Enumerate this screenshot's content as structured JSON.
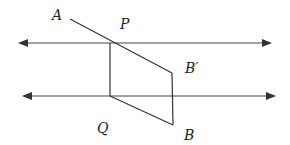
{
  "diagram": {
    "type": "geometry",
    "colors": {
      "line": "#333333",
      "background": "#ffffff"
    },
    "points": {
      "A": {
        "label": "A",
        "x": 70,
        "y": 19,
        "label_x": 55,
        "label_y": 19
      },
      "P": {
        "label": "P",
        "x": 110,
        "y": 43,
        "label_x": 121,
        "label_y": 27
      },
      "B_prime": {
        "label": "B′",
        "x": 172,
        "y": 73,
        "label_x": 186,
        "label_y": 72
      },
      "Q": {
        "label": "Q",
        "x": 110,
        "y": 96,
        "label_x": 98,
        "label_y": 131
      },
      "B": {
        "label": "B",
        "x": 173,
        "y": 125,
        "label_x": 183,
        "label_y": 138
      }
    },
    "lines": {
      "top_parallel": {
        "x1": 24,
        "y1": 43,
        "x2": 266,
        "y2": 43,
        "arrows": "both"
      },
      "bottom_parallel": {
        "x1": 28,
        "y1": 96,
        "x2": 270,
        "y2": 96,
        "arrows": "both"
      }
    },
    "segments": [
      {
        "name": "A-P-B′",
        "from": "A",
        "to": "B_prime"
      },
      {
        "name": "P-Q",
        "from": "P",
        "to": "Q"
      },
      {
        "name": "Q-B",
        "from": "Q",
        "to": "B"
      },
      {
        "name": "B′-B",
        "from": "B_prime",
        "to": "B"
      }
    ]
  }
}
